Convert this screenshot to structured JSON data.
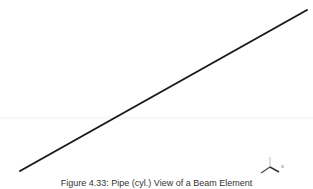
{
  "figure": {
    "caption": "Figure 4.33: Pipe (cyl.) View of a Beam Element"
  },
  "scene": {
    "element": {
      "type": "beam-element-line",
      "start": [
        20,
        171
      ],
      "end": [
        307,
        10
      ],
      "color": "#1a1a1a"
    },
    "triad": {
      "axis_label": "x",
      "color": "#555555"
    },
    "background": "#ffffff"
  }
}
